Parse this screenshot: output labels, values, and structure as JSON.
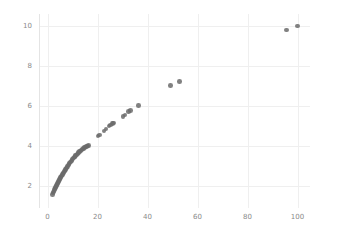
{
  "chart_data": {
    "type": "scatter",
    "title": "",
    "xlabel": "",
    "ylabel": "",
    "xlim": [
      -3,
      105
    ],
    "ylim": [
      0.9,
      10.6
    ],
    "xticks": [
      0,
      20,
      40,
      60,
      80,
      100
    ],
    "yticks": [
      2,
      4,
      6,
      8,
      10
    ],
    "xticklabels": [
      "0",
      "20",
      "40",
      "60",
      "80",
      "100"
    ],
    "yticklabels": [
      "2",
      "4",
      "6",
      "8",
      "10"
    ],
    "grid": true,
    "legend": null,
    "marker": {
      "shape": "circle",
      "color": "#6b6b6b",
      "size": 4.6,
      "opacity": 0.85
    },
    "series": [
      {
        "name": "series-1",
        "points": [
          [
            2.0,
            1.58
          ],
          [
            2.2,
            1.64
          ],
          [
            2.4,
            1.7
          ],
          [
            2.6,
            1.76
          ],
          [
            2.8,
            1.82
          ],
          [
            3.0,
            1.88
          ],
          [
            3.2,
            1.93
          ],
          [
            3.4,
            1.98
          ],
          [
            3.6,
            2.03
          ],
          [
            3.8,
            2.08
          ],
          [
            4.0,
            2.13
          ],
          [
            4.2,
            2.18
          ],
          [
            4.4,
            2.23
          ],
          [
            4.6,
            2.28
          ],
          [
            4.8,
            2.33
          ],
          [
            5.0,
            2.38
          ],
          [
            5.2,
            2.42
          ],
          [
            5.4,
            2.46
          ],
          [
            5.6,
            2.5
          ],
          [
            5.8,
            2.54
          ],
          [
            6.0,
            2.58
          ],
          [
            6.2,
            2.62
          ],
          [
            6.4,
            2.66
          ],
          [
            6.6,
            2.7
          ],
          [
            6.8,
            2.74
          ],
          [
            7.0,
            2.78
          ],
          [
            7.2,
            2.82
          ],
          [
            7.4,
            2.86
          ],
          [
            7.6,
            2.9
          ],
          [
            7.8,
            2.94
          ],
          [
            8.0,
            2.98
          ],
          [
            8.3,
            3.04
          ],
          [
            8.6,
            3.1
          ],
          [
            8.9,
            3.15
          ],
          [
            9.2,
            3.2
          ],
          [
            9.5,
            3.25
          ],
          [
            9.8,
            3.3
          ],
          [
            10.1,
            3.35
          ],
          [
            10.4,
            3.4
          ],
          [
            10.7,
            3.44
          ],
          [
            11.0,
            3.48
          ],
          [
            11.3,
            3.52
          ],
          [
            11.6,
            3.56
          ],
          [
            11.9,
            3.6
          ],
          [
            12.2,
            3.64
          ],
          [
            12.5,
            3.68
          ],
          [
            12.9,
            3.72
          ],
          [
            13.3,
            3.76
          ],
          [
            13.7,
            3.8
          ],
          [
            14.1,
            3.84
          ],
          [
            14.5,
            3.88
          ],
          [
            14.9,
            3.92
          ],
          [
            15.3,
            3.95
          ],
          [
            15.7,
            3.98
          ],
          [
            16.1,
            4.0
          ],
          [
            16.5,
            4.02
          ],
          [
            20.2,
            4.5
          ],
          [
            20.8,
            4.55
          ],
          [
            22.6,
            4.76
          ],
          [
            23.4,
            4.84
          ],
          [
            24.6,
            5.0
          ],
          [
            25.3,
            5.06
          ],
          [
            26.0,
            5.12
          ],
          [
            26.5,
            5.16
          ],
          [
            30.2,
            5.48
          ],
          [
            31.0,
            5.54
          ],
          [
            32.5,
            5.72
          ],
          [
            33.2,
            5.78
          ],
          [
            36.3,
            6.02
          ],
          [
            49.2,
            7.02
          ],
          [
            52.7,
            7.22
          ],
          [
            95.7,
            9.8
          ],
          [
            100.0,
            10.0
          ]
        ]
      }
    ]
  }
}
